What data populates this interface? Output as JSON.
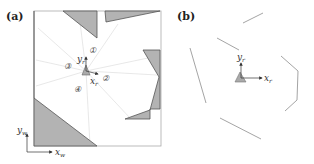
{
  "panels": [
    {
      "label": "(a)",
      "world_axes": {
        "x_label": "x",
        "x_sub": "w",
        "y_label": "y",
        "y_sub": "w"
      },
      "robot_axes": {
        "x_label": "x",
        "x_sub": "r",
        "y_label": "y",
        "y_sub": "r"
      },
      "regions": [
        "①",
        "②",
        "③",
        "④"
      ]
    },
    {
      "label": "(b)",
      "robot_axes": {
        "x_label": "x",
        "x_sub": "r",
        "y_label": "y",
        "y_sub": "r"
      }
    }
  ],
  "colors": {
    "obstacle_fill": "#b3b3b3",
    "obstacle_stroke": "#555555",
    "ray": "#e0e0e0",
    "frame": "#999999",
    "scan": "#9a9a9a"
  }
}
